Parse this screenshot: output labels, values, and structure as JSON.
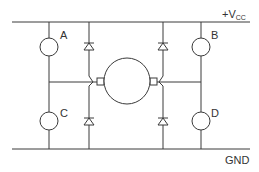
{
  "diagram": {
    "type": "H-bridge motor driver circuit",
    "rails": {
      "top": {
        "label": "+V",
        "subscript": "CC"
      },
      "bottom": {
        "label": "GND"
      }
    },
    "switches": [
      {
        "id": "A",
        "label": "A",
        "position": "top-left"
      },
      {
        "id": "B",
        "label": "B",
        "position": "top-right"
      },
      {
        "id": "C",
        "label": "C",
        "position": "bottom-left"
      },
      {
        "id": "D",
        "label": "D",
        "position": "bottom-right"
      }
    ],
    "diodes": [
      {
        "position": "top-left",
        "orientation": "cathode-up"
      },
      {
        "position": "top-right",
        "orientation": "cathode-up"
      },
      {
        "position": "bottom-left",
        "orientation": "cathode-up"
      },
      {
        "position": "bottom-right",
        "orientation": "cathode-up"
      }
    ],
    "motor": {
      "label": ""
    },
    "colors": {
      "line": "#3a3a3a",
      "background": "#ffffff"
    }
  }
}
